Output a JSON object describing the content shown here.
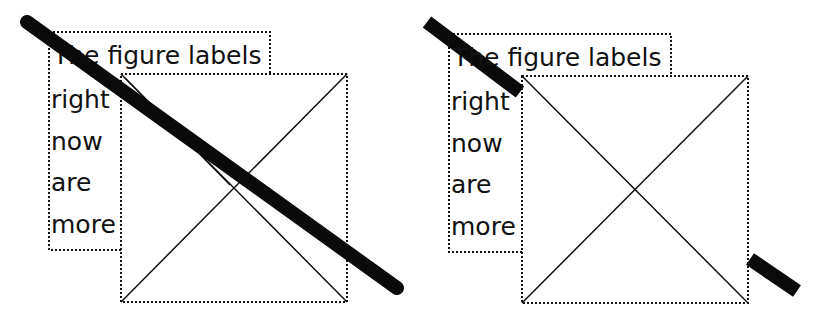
{
  "colors": {
    "background": "#ffffff",
    "ink": "#111111",
    "stroke": "#0a0a0a"
  },
  "panels": [
    {
      "id": "left",
      "description": "Thick stroke drawn across entire figure (on top)",
      "text_lines": [
        "The figure labels",
        "right",
        "now",
        "are",
        "more"
      ]
    },
    {
      "id": "right",
      "description": "Thick stroke clipped by the square box",
      "text_lines": [
        "The figure labels",
        "right",
        "now",
        "are",
        "more"
      ]
    }
  ]
}
